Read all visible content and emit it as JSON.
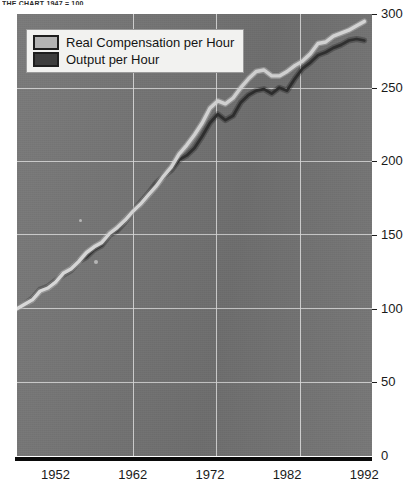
{
  "header": {
    "clipped_text": "THE CHART  1947 = 100"
  },
  "legend": {
    "position": "top-left",
    "items": [
      {
        "label": "Real Compensation per Hour",
        "color": "#b3b3b3",
        "series_key": "real_compensation"
      },
      {
        "label": "Output per Hour",
        "color": "#3d3d3d",
        "series_key": "output"
      }
    ]
  },
  "colors": {
    "plot_background": "#737373",
    "gridline": "#d8d8d8",
    "axis": "#0a0a0a",
    "legend_background": "#f2f2f0",
    "line_light": "#d9d9d9",
    "line_dark": "#2e2e2e",
    "text": "#1a1a1a"
  },
  "chart_data": {
    "type": "line",
    "title": "",
    "xlabel": "",
    "ylabel": "",
    "xlim": [
      1947,
      1993
    ],
    "ylim": [
      0,
      300
    ],
    "grid": true,
    "legend_position": "top-left",
    "xticks": [
      1952,
      1962,
      1972,
      1982,
      1992
    ],
    "yticks": [
      0,
      50,
      100,
      150,
      200,
      250,
      300
    ],
    "x": [
      1947,
      1948,
      1949,
      1950,
      1951,
      1952,
      1953,
      1954,
      1955,
      1956,
      1957,
      1958,
      1959,
      1960,
      1961,
      1962,
      1963,
      1964,
      1965,
      1966,
      1967,
      1968,
      1969,
      1970,
      1971,
      1972,
      1973,
      1974,
      1975,
      1976,
      1977,
      1978,
      1979,
      1980,
      1981,
      1982,
      1983,
      1984,
      1985,
      1986,
      1987,
      1988,
      1989,
      1990,
      1991,
      1992
    ],
    "series": [
      {
        "name": "Real Compensation per Hour",
        "color": "#d9d9d9",
        "values": [
          100,
          103,
          106,
          112,
          114,
          118,
          124,
          127,
          132,
          138,
          142,
          145,
          151,
          155,
          160,
          166,
          171,
          177,
          183,
          190,
          196,
          205,
          211,
          218,
          226,
          236,
          241,
          239,
          243,
          250,
          256,
          261,
          262,
          258,
          258,
          261,
          265,
          268,
          273,
          280,
          281,
          285,
          287,
          289,
          292,
          295
        ]
      },
      {
        "name": "Output per Hour",
        "color": "#2e2e2e",
        "values": [
          100,
          103,
          107,
          113,
          115,
          119,
          123,
          126,
          132,
          135,
          140,
          143,
          150,
          153,
          159,
          166,
          172,
          178,
          185,
          190,
          194,
          201,
          204,
          209,
          217,
          226,
          232,
          228,
          231,
          240,
          245,
          248,
          249,
          246,
          250,
          248,
          256,
          263,
          267,
          272,
          274,
          277,
          279,
          282,
          283,
          282
        ]
      }
    ]
  }
}
